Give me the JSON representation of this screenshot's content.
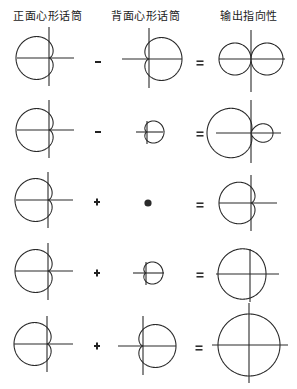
{
  "headers": [
    {
      "label": "正面心形话筒",
      "x": 13
    },
    {
      "label": "背面心形话筒",
      "x": 111
    },
    {
      "label": "输出指向性",
      "x": 220
    }
  ],
  "style": {
    "stroke": "#2a2a2a",
    "stroke_width": 1.1
  },
  "rows": [
    {
      "operator": "-",
      "equals": "=",
      "front": {
        "cx": 49,
        "cy": 58,
        "a": 16.5,
        "axis_h": [
          17,
          74
        ],
        "axis_v": [
          27,
          86
        ]
      },
      "back": {
        "type": "cardioid",
        "cx": 149,
        "cy": 59,
        "a": 16.5,
        "axis_h": [
          122,
          182
        ],
        "axis_v": [
          28,
          88
        ]
      },
      "output": {
        "type": "figure8",
        "cx": 251,
        "cy": 59,
        "k": 1.0,
        "b": 0,
        "scale": 32,
        "axis_h": [
          219,
          285
        ],
        "axis_v": [
          30,
          92
        ]
      },
      "op_pos": {
        "x": 98,
        "y": 62
      },
      "eq_pos": {
        "x": 200,
        "y": 63
      }
    },
    {
      "operator": "-",
      "equals": "=",
      "front": {
        "cx": 49,
        "cy": 130,
        "a": 16.5,
        "axis_h": [
          17,
          74
        ],
        "axis_v": [
          100,
          158
        ]
      },
      "back": {
        "type": "cardioid",
        "cx": 147,
        "cy": 132,
        "a": 8.5,
        "axis_h": [
          136,
          163
        ],
        "axis_v": [
          121,
          144
        ]
      },
      "output": {
        "type": "polar",
        "cx": 251,
        "cy": 133,
        "b": 0.5,
        "k": 1.5,
        "scale": 22,
        "axis_h": [
          216,
          281
        ],
        "axis_v": [
          100,
          163
        ]
      },
      "op_pos": {
        "x": 98,
        "y": 132
      },
      "eq_pos": {
        "x": 200,
        "y": 134
      }
    },
    {
      "operator": "+",
      "equals": "=",
      "front": {
        "cx": 48,
        "cy": 200,
        "a": 16.5,
        "axis_h": [
          16,
          73
        ],
        "axis_v": [
          172,
          228
        ]
      },
      "back": {
        "type": "dot",
        "cx": 148,
        "cy": 203,
        "r": 3.6
      },
      "output": {
        "type": "polar",
        "cx": 251,
        "cy": 203,
        "b": 1.0,
        "k": 1.0,
        "scale": 16,
        "axis_h": [
          219,
          277
        ],
        "axis_v": [
          175,
          231
        ]
      },
      "op_pos": {
        "x": 97,
        "y": 202
      },
      "eq_pos": {
        "x": 200,
        "y": 205
      }
    },
    {
      "operator": "+",
      "equals": "=",
      "front": {
        "cx": 48,
        "cy": 271,
        "a": 16.5,
        "axis_h": [
          15,
          73
        ],
        "axis_v": [
          243,
          300
        ]
      },
      "back": {
        "type": "cardioid",
        "cx": 146,
        "cy": 273,
        "a": 8.5,
        "axis_h": [
          133,
          164
        ],
        "axis_v": [
          262,
          285
        ]
      },
      "output": {
        "type": "polar",
        "cx": 250,
        "cy": 274,
        "b": 1.5,
        "k": 0.5,
        "scale": 16,
        "axis_h": [
          216,
          279
        ],
        "axis_v": [
          249,
          302
        ]
      },
      "op_pos": {
        "x": 97,
        "y": 273
      },
      "eq_pos": {
        "x": 200,
        "y": 275
      }
    },
    {
      "operator": "+",
      "equals": "=",
      "front": {
        "cx": 47,
        "cy": 344,
        "a": 16.5,
        "axis_h": [
          14,
          73
        ],
        "axis_v": [
          316,
          372
        ]
      },
      "back": {
        "type": "cardioid",
        "cx": 143,
        "cy": 346,
        "a": 16.5,
        "axis_h": [
          118,
          176
        ],
        "axis_v": [
          316,
          375
        ]
      },
      "output": {
        "type": "polar",
        "cx": 249,
        "cy": 345,
        "b": 2.0,
        "k": 0,
        "scale": 15.5,
        "axis_h": [
          212,
          288
        ],
        "axis_v": [
          303,
          383
        ]
      },
      "op_pos": {
        "x": 97,
        "y": 346
      },
      "eq_pos": {
        "x": 199,
        "y": 348
      }
    }
  ]
}
